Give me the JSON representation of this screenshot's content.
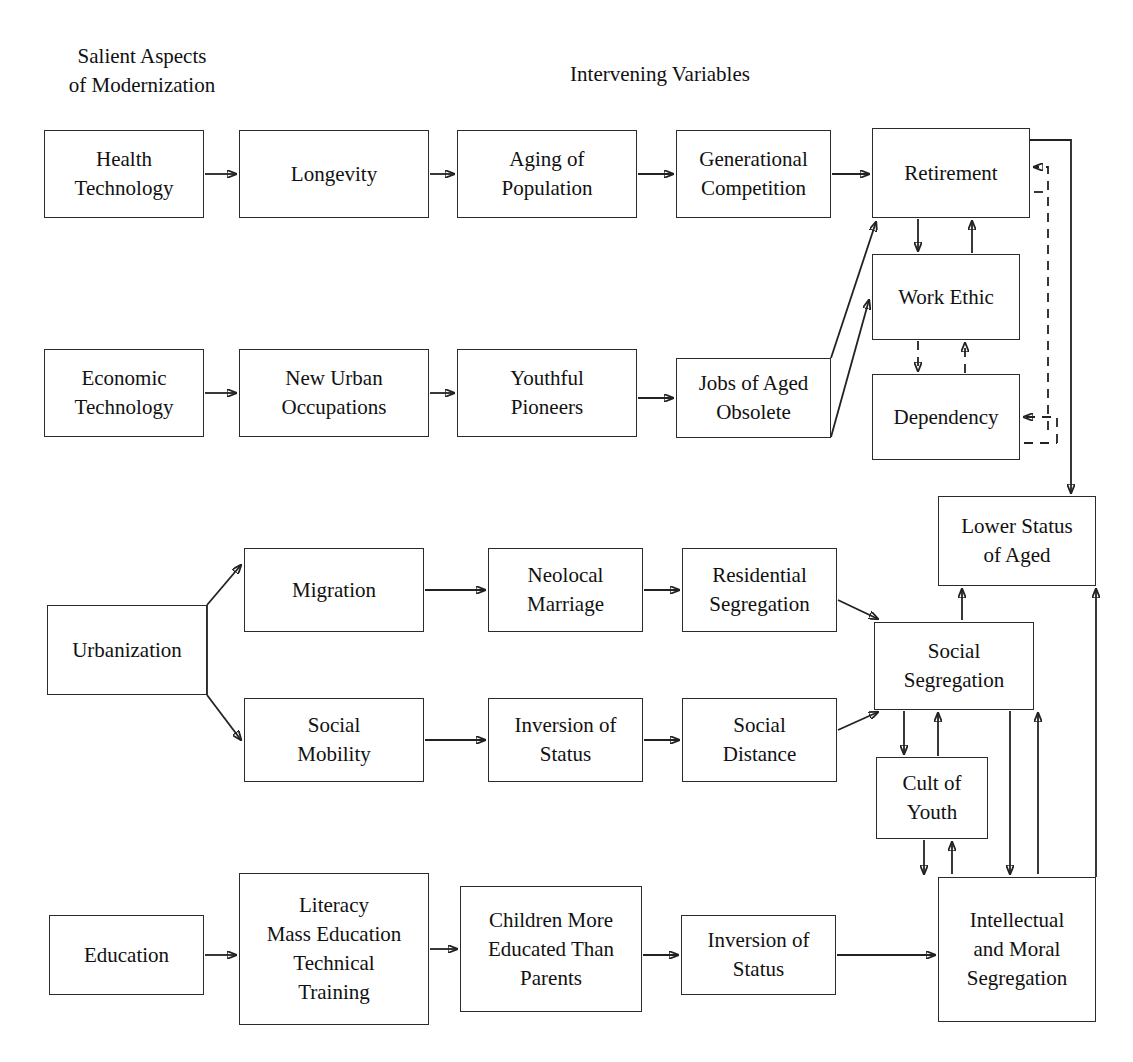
{
  "diagram": {
    "headers": [
      {
        "id": "hdr-salient",
        "text": "Salient Aspects\nof Modernization",
        "x": 44,
        "y": 42,
        "w": 196
      },
      {
        "id": "hdr-intervening",
        "text": "Intervening Variables",
        "x": 540,
        "y": 60,
        "w": 240
      }
    ],
    "nodes": [
      {
        "id": "health-technology",
        "label": "Health\nTechnology",
        "x": 44,
        "y": 130,
        "w": 160,
        "h": 88
      },
      {
        "id": "longevity",
        "label": "Longevity",
        "x": 239,
        "y": 130,
        "w": 190,
        "h": 88
      },
      {
        "id": "aging-of-population",
        "label": "Aging of\nPopulation",
        "x": 457,
        "y": 130,
        "w": 180,
        "h": 88
      },
      {
        "id": "generational-competition",
        "label": "Generational\nCompetition",
        "x": 676,
        "y": 130,
        "w": 155,
        "h": 88
      },
      {
        "id": "retirement",
        "label": "Retirement",
        "x": 872,
        "y": 128,
        "w": 158,
        "h": 90
      },
      {
        "id": "economic-technology",
        "label": "Economic\nTechnology",
        "x": 44,
        "y": 349,
        "w": 160,
        "h": 88
      },
      {
        "id": "new-urban-occupations",
        "label": "New Urban\nOccupations",
        "x": 239,
        "y": 349,
        "w": 190,
        "h": 88
      },
      {
        "id": "youthful-pioneers",
        "label": "Youthful\nPioneers",
        "x": 457,
        "y": 349,
        "w": 180,
        "h": 88
      },
      {
        "id": "jobs-of-aged-obsolete",
        "label": "Jobs of Aged\nObsolete",
        "x": 676,
        "y": 358,
        "w": 155,
        "h": 80
      },
      {
        "id": "work-ethic",
        "label": "Work Ethic",
        "x": 872,
        "y": 254,
        "w": 148,
        "h": 86
      },
      {
        "id": "dependency",
        "label": "Dependency",
        "x": 872,
        "y": 374,
        "w": 148,
        "h": 86
      },
      {
        "id": "lower-status-of-aged",
        "label": "Lower Status\nof Aged",
        "x": 938,
        "y": 496,
        "w": 158,
        "h": 90
      },
      {
        "id": "urbanization",
        "label": "Urbanization",
        "x": 47,
        "y": 605,
        "w": 160,
        "h": 90
      },
      {
        "id": "migration",
        "label": "Migration",
        "x": 244,
        "y": 548,
        "w": 180,
        "h": 84
      },
      {
        "id": "neolocal-marriage",
        "label": "Neolocal\nMarriage",
        "x": 488,
        "y": 548,
        "w": 155,
        "h": 84
      },
      {
        "id": "residential-segregation",
        "label": "Residential\nSegregation",
        "x": 682,
        "y": 548,
        "w": 155,
        "h": 84
      },
      {
        "id": "social-mobility",
        "label": "Social\nMobility",
        "x": 244,
        "y": 698,
        "w": 180,
        "h": 84
      },
      {
        "id": "inversion-of-status-1",
        "label": "Inversion of\nStatus",
        "x": 488,
        "y": 698,
        "w": 155,
        "h": 84
      },
      {
        "id": "social-distance",
        "label": "Social\nDistance",
        "x": 682,
        "y": 698,
        "w": 155,
        "h": 84
      },
      {
        "id": "social-segregation",
        "label": "Social\nSegregation",
        "x": 874,
        "y": 622,
        "w": 160,
        "h": 88
      },
      {
        "id": "cult-of-youth",
        "label": "Cult of\nYouth",
        "x": 876,
        "y": 757,
        "w": 112,
        "h": 82
      },
      {
        "id": "education",
        "label": "Education",
        "x": 49,
        "y": 915,
        "w": 155,
        "h": 80
      },
      {
        "id": "literacy-mass-education",
        "label": "Literacy\nMass Education\nTechnical\nTraining",
        "x": 239,
        "y": 873,
        "w": 190,
        "h": 152
      },
      {
        "id": "children-more-educated",
        "label": "Children More\nEducated Than\nParents",
        "x": 460,
        "y": 886,
        "w": 182,
        "h": 126
      },
      {
        "id": "inversion-of-status-2",
        "label": "Inversion of\nStatus",
        "x": 681,
        "y": 915,
        "w": 155,
        "h": 80
      },
      {
        "id": "intellectual-moral-seg",
        "label": "Intellectual\nand Moral\nSegregation",
        "x": 938,
        "y": 877,
        "w": 158,
        "h": 145
      }
    ],
    "edges": [
      {
        "id": "e-health-longevity",
        "from": "health-technology",
        "to": "longevity",
        "style": "solid",
        "shape": "straight"
      },
      {
        "id": "e-longevity-aging",
        "from": "longevity",
        "to": "aging-of-population",
        "style": "solid",
        "shape": "straight"
      },
      {
        "id": "e-aging-generational",
        "from": "aging-of-population",
        "to": "generational-competition",
        "style": "solid",
        "shape": "straight"
      },
      {
        "id": "e-generational-retirement",
        "from": "generational-competition",
        "to": "retirement",
        "style": "solid",
        "shape": "straight"
      },
      {
        "id": "e-economic-newurban",
        "from": "economic-technology",
        "to": "new-urban-occupations",
        "style": "solid",
        "shape": "straight"
      },
      {
        "id": "e-newurban-youthful",
        "from": "new-urban-occupations",
        "to": "youthful-pioneers",
        "style": "solid",
        "shape": "straight"
      },
      {
        "id": "e-youthful-jobs",
        "from": "youthful-pioneers",
        "to": "jobs-of-aged-obsolete",
        "style": "solid",
        "shape": "straight"
      },
      {
        "id": "e-jobs-retirement",
        "from": "jobs-of-aged-obsolete",
        "to": "retirement",
        "style": "solid",
        "shape": "diagonal"
      },
      {
        "id": "e-jobs-workethic",
        "from": "jobs-of-aged-obsolete",
        "to": "work-ethic",
        "style": "solid",
        "shape": "diagonal"
      },
      {
        "id": "e-retirement-workethic",
        "from": "retirement",
        "to": "work-ethic",
        "style": "solid",
        "shape": "straight"
      },
      {
        "id": "e-workethic-retirement",
        "from": "work-ethic",
        "to": "retirement",
        "style": "solid",
        "shape": "straight"
      },
      {
        "id": "e-workethic-dependency",
        "from": "work-ethic",
        "to": "dependency",
        "style": "dashed",
        "shape": "straight"
      },
      {
        "id": "e-dependency-workethic",
        "from": "dependency",
        "to": "work-ethic",
        "style": "dashed",
        "shape": "straight"
      },
      {
        "id": "e-retirement-lowerstatus",
        "from": "retirement",
        "to": "lower-status-of-aged",
        "style": "solid",
        "shape": "orthogonal"
      },
      {
        "id": "e-lowerstatus-retirement",
        "from": "lower-status-of-aged",
        "to": "retirement",
        "style": "dashed",
        "shape": "orthogonal"
      },
      {
        "id": "e-lowerstatus-dependency",
        "from": "lower-status-of-aged",
        "to": "dependency",
        "style": "dashed",
        "shape": "orthogonal"
      },
      {
        "id": "e-urbanization-migration",
        "from": "urbanization",
        "to": "migration",
        "style": "solid",
        "shape": "diagonal"
      },
      {
        "id": "e-urbanization-socialmobility",
        "from": "urbanization",
        "to": "social-mobility",
        "style": "solid",
        "shape": "diagonal"
      },
      {
        "id": "e-migration-neolocal",
        "from": "migration",
        "to": "neolocal-marriage",
        "style": "solid",
        "shape": "straight"
      },
      {
        "id": "e-neolocal-residential",
        "from": "neolocal-marriage",
        "to": "residential-segregation",
        "style": "solid",
        "shape": "straight"
      },
      {
        "id": "e-residential-socialseg",
        "from": "residential-segregation",
        "to": "social-segregation",
        "style": "solid",
        "shape": "diagonal"
      },
      {
        "id": "e-socialmobility-inversion",
        "from": "social-mobility",
        "to": "inversion-of-status-1",
        "style": "solid",
        "shape": "straight"
      },
      {
        "id": "e-inversion-socialdistance",
        "from": "inversion-of-status-1",
        "to": "social-distance",
        "style": "solid",
        "shape": "straight"
      },
      {
        "id": "e-socialdistance-socialseg",
        "from": "social-distance",
        "to": "social-segregation",
        "style": "solid",
        "shape": "diagonal"
      },
      {
        "id": "e-socialseg-lowerstatus",
        "from": "social-segregation",
        "to": "lower-status-of-aged",
        "style": "solid",
        "shape": "straight"
      },
      {
        "id": "e-socialseg-cult",
        "from": "social-segregation",
        "to": "cult-of-youth",
        "style": "solid",
        "shape": "straight"
      },
      {
        "id": "e-cult-socialseg",
        "from": "cult-of-youth",
        "to": "social-segregation",
        "style": "solid",
        "shape": "straight"
      },
      {
        "id": "e-socialseg-intellectual",
        "from": "social-segregation",
        "to": "intellectual-moral-seg",
        "style": "solid",
        "shape": "orthogonal"
      },
      {
        "id": "e-intellectual-socialseg",
        "from": "intellectual-moral-seg",
        "to": "social-segregation",
        "style": "solid",
        "shape": "orthogonal"
      },
      {
        "id": "e-cult-intellectual",
        "from": "cult-of-youth",
        "to": "intellectual-moral-seg",
        "style": "solid",
        "shape": "orthogonal"
      },
      {
        "id": "e-intellectual-cult",
        "from": "intellectual-moral-seg",
        "to": "cult-of-youth",
        "style": "solid",
        "shape": "orthogonal"
      },
      {
        "id": "e-intellectual-lowerstatus",
        "from": "intellectual-moral-seg",
        "to": "lower-status-of-aged",
        "style": "solid",
        "shape": "orthogonal"
      },
      {
        "id": "e-education-literacy",
        "from": "education",
        "to": "literacy-mass-education",
        "style": "solid",
        "shape": "straight"
      },
      {
        "id": "e-literacy-children",
        "from": "literacy-mass-education",
        "to": "children-more-educated",
        "style": "solid",
        "shape": "straight"
      },
      {
        "id": "e-children-inversion",
        "from": "children-more-educated",
        "to": "inversion-of-status-2",
        "style": "solid",
        "shape": "straight"
      },
      {
        "id": "e-inversion2-intellectual",
        "from": "inversion-of-status-2",
        "to": "intellectual-moral-seg",
        "style": "solid",
        "shape": "straight"
      }
    ],
    "colors": {
      "background": "#ffffff",
      "stroke": "#222222",
      "text": "#111111",
      "box_border": "#2b2b2b"
    }
  }
}
